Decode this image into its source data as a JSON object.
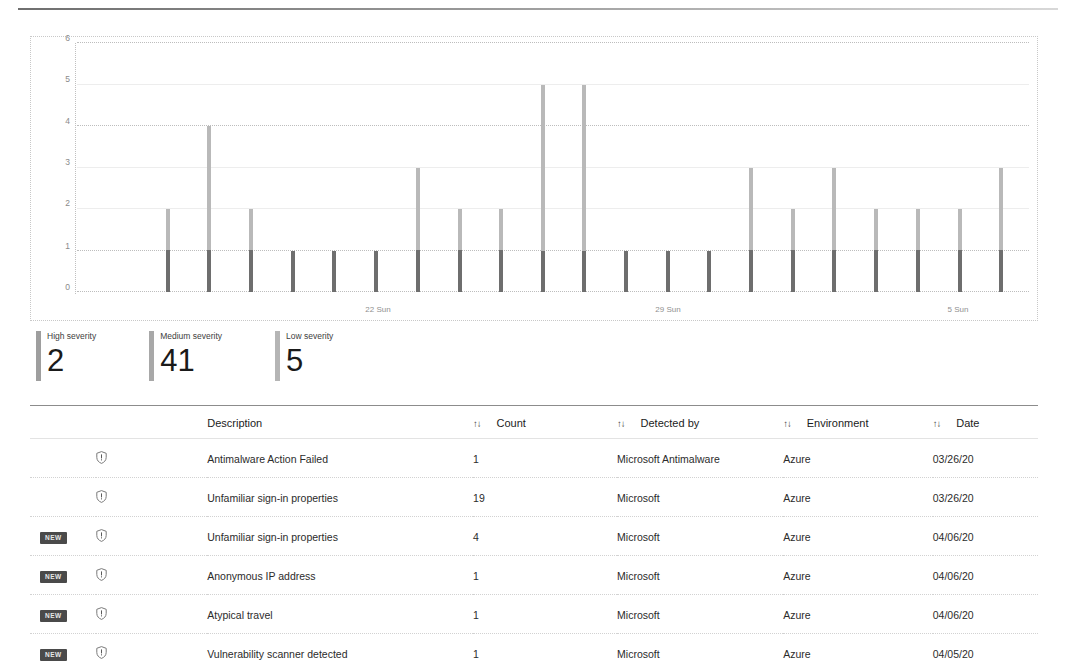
{
  "chart_data": {
    "type": "bar",
    "title": "",
    "xlabel": "",
    "ylabel": "",
    "ylim": [
      0,
      6
    ],
    "yticks": [
      0,
      1,
      2,
      3,
      4,
      5,
      6
    ],
    "grid": true,
    "legend_position": "below",
    "x_tick_labels": [
      "22 Sun",
      "29 Sun",
      "5 Sun"
    ],
    "x_tick_positions_px": [
      347,
      637,
      927
    ],
    "bars": [
      {
        "x_px": 135,
        "value": 2
      },
      {
        "x_px": 176,
        "value": 4
      },
      {
        "x_px": 218,
        "value": 2
      },
      {
        "x_px": 260,
        "value": 1
      },
      {
        "x_px": 301,
        "value": 1
      },
      {
        "x_px": 343,
        "value": 1
      },
      {
        "x_px": 385,
        "value": 3
      },
      {
        "x_px": 427,
        "value": 2
      },
      {
        "x_px": 468,
        "value": 2
      },
      {
        "x_px": 510,
        "value": 5
      },
      {
        "x_px": 551,
        "value": 5
      },
      {
        "x_px": 593,
        "value": 1
      },
      {
        "x_px": 635,
        "value": 1
      },
      {
        "x_px": 676,
        "value": 1
      },
      {
        "x_px": 718,
        "value": 3
      },
      {
        "x_px": 760,
        "value": 2
      },
      {
        "x_px": 801,
        "value": 3
      },
      {
        "x_px": 843,
        "value": 2
      },
      {
        "x_px": 885,
        "value": 2
      },
      {
        "x_px": 927,
        "value": 2
      },
      {
        "x_px": 968,
        "value": 3
      }
    ]
  },
  "severity": {
    "cards": [
      {
        "label": "High severity",
        "value": "2",
        "color": "#9e9e9e"
      },
      {
        "label": "Medium severity",
        "value": "41",
        "color": "#a8a8a8"
      },
      {
        "label": "Low severity",
        "value": "5",
        "color": "#b5b5b5"
      }
    ]
  },
  "table": {
    "sort_icon": "↑↓",
    "columns": {
      "new": "",
      "icon": "",
      "description": "Description",
      "count": "Count",
      "detected_by": "Detected by",
      "environment": "Environment",
      "date": "Date"
    },
    "rows": [
      {
        "badge": "",
        "icon": "shield-alert-icon",
        "description": "Antimalware Action Failed",
        "count": "1",
        "detected_by": "Microsoft Antimalware",
        "environment": "Azure",
        "date": "03/26/20"
      },
      {
        "badge": "",
        "icon": "shield-alert-icon",
        "description": "Unfamiliar sign-in properties",
        "count": "19",
        "detected_by": "Microsoft",
        "environment": "Azure",
        "date": "03/26/20"
      },
      {
        "badge": "NEW",
        "icon": "shield-alert-icon",
        "description": "Unfamiliar sign-in properties",
        "count": "4",
        "detected_by": "Microsoft",
        "environment": "Azure",
        "date": "04/06/20"
      },
      {
        "badge": "NEW",
        "icon": "shield-alert-icon",
        "description": "Anonymous IP address",
        "count": "1",
        "detected_by": "Microsoft",
        "environment": "Azure",
        "date": "04/06/20"
      },
      {
        "badge": "NEW",
        "icon": "shield-alert-icon",
        "description": "Atypical travel",
        "count": "1",
        "detected_by": "Microsoft",
        "environment": "Azure",
        "date": "04/06/20"
      },
      {
        "badge": "NEW",
        "icon": "shield-alert-icon",
        "description": "Vulnerability scanner detected",
        "count": "1",
        "detected_by": "Microsoft",
        "environment": "Azure",
        "date": "04/05/20"
      }
    ]
  },
  "colors": {
    "bar_light": "#b9b9b9",
    "bar_dark": "#6e6e6e",
    "grid_solid": "#ededed",
    "grid_dotted": "#bdbdbd",
    "badge_bg": "#4a4a4a"
  }
}
